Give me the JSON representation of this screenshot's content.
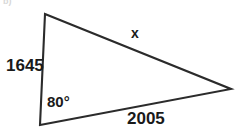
{
  "figure": {
    "background_color": "#ffffff",
    "stroke_color": "#2b2b2b",
    "label_color": "#1a1a1a",
    "corner_mark": "b)",
    "shape": "triangle",
    "vertices": {
      "top": {
        "x": 45,
        "y": 14
      },
      "bottom_left": {
        "x": 40,
        "y": 125
      },
      "right": {
        "x": 231,
        "y": 89
      }
    },
    "labels": {
      "side_left": "1645",
      "side_bottom": "2005",
      "side_x": "x",
      "angle_a": "80°"
    }
  },
  "chart_data": {
    "type": "diagram",
    "title": "",
    "shape": "triangle",
    "vertices": [
      {
        "name": "A",
        "role": "bottom-left",
        "x": 40,
        "y": 125
      },
      {
        "name": "B",
        "role": "top",
        "x": 45,
        "y": 14
      },
      {
        "name": "C",
        "role": "right",
        "x": 231,
        "y": 89
      }
    ],
    "sides": [
      {
        "from": "A",
        "to": "B",
        "label": "1645",
        "value": 1645,
        "position": "left"
      },
      {
        "from": "A",
        "to": "C",
        "label": "2005",
        "value": 2005,
        "position": "bottom"
      },
      {
        "from": "B",
        "to": "C",
        "label": "x",
        "value": null,
        "position": "upper-right"
      }
    ],
    "angles": [
      {
        "at": "A",
        "label": "80°",
        "value": 80,
        "unit": "degrees"
      }
    ],
    "annotations": [
      "1645",
      "2005",
      "x",
      "80°"
    ],
    "grid": false,
    "legend": false
  }
}
